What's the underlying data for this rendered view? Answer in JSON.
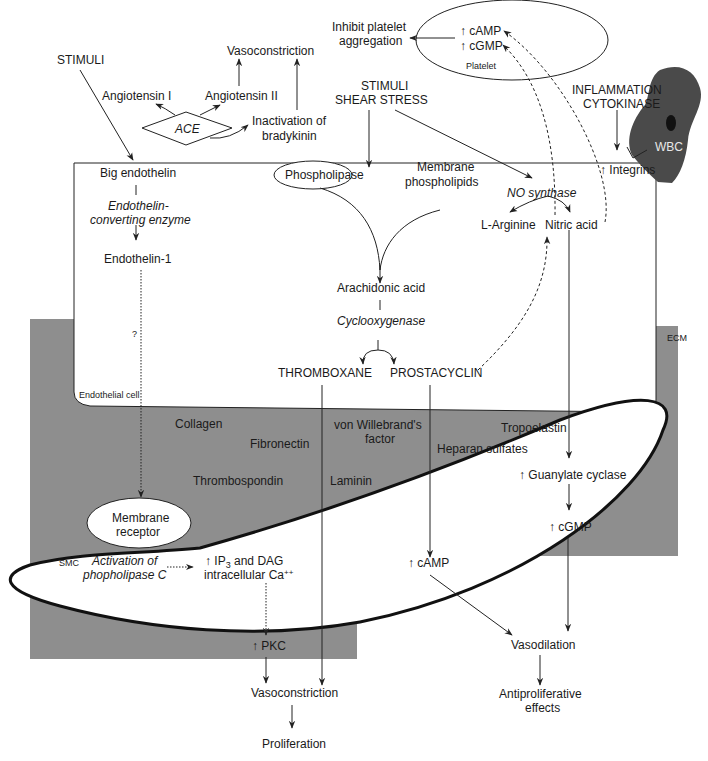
{
  "colors": {
    "ecm_fill": "#8e8e8e",
    "wbc_fill": "#4a4a4a",
    "line": "#222222",
    "background": "#ffffff"
  },
  "labels": {
    "stimuli_left": "STIMULI",
    "angiotensin_1": "Angiotensin I",
    "angiotensin_2": "Angiotensin II",
    "ace": "ACE",
    "vasoconstriction_top": "Vasoconstriction",
    "inactivation_1": "Inactivation of",
    "inactivation_2": "bradykinin",
    "inhibit_1": "Inhibit platelet",
    "inhibit_2": "aggregation",
    "platelet_camp": "↑ cAMP",
    "platelet_cgmp": "↑ cGMP",
    "platelet": "Platelet",
    "stimuli_center_1": "STIMULI",
    "stimuli_center_2": "SHEAR STRESS",
    "inflammation_1": "INFLAMMATION",
    "inflammation_2": "CYTOKINASE",
    "wbc": "WBC",
    "integrins": "↑ Integrins",
    "big_endothelin": "Big endothelin",
    "ece_1": "Endothelin-",
    "ece_2": "converting enzyme",
    "endothelin_1": "Endothelin-1",
    "question": "?",
    "endothelial_cell": "Endothelial cell",
    "phospholipase": "Phospholipase",
    "membrane_phospholipids_1": "Membrane",
    "membrane_phospholipids_2": "phospholipids",
    "no_synthase": "NO synthase",
    "l_arginine": "L-Arginine",
    "nitric_acid": "Nitric acid",
    "arachidonic_acid": "Arachidonic acid",
    "cyclooxygenase": "Cyclooxygenase",
    "thromboxane": "THROMBOXANE",
    "prostacyclin": "PROSTACYCLIN",
    "ecm": "ECM",
    "collagen": "Collagen",
    "fibronectin": "Fibronectin",
    "von_willebrand_1": "von Willebrand's",
    "von_willebrand_2": "factor",
    "tropoelastin": "Tropoelastin",
    "heparan_sulfates": "Heparan sulfates",
    "thrombospondin": "Thrombospondin",
    "laminin": "Laminin",
    "membrane_receptor_1": "Membrane",
    "membrane_receptor_2": "receptor",
    "smc": "SMC",
    "activation_plc_1": "Activation of",
    "activation_plc_2": "phopholipase C",
    "ip3_dag_1": "↑ IP",
    "ip3_sub": "3",
    "ip3_dag_1b": " and DAG",
    "ip3_dag_2": "intracellular Ca",
    "ca_sup": "++",
    "guanylate_cyclase": "↑ Guanylate cyclase",
    "cgmp_smc": "↑ cGMP",
    "camp_smc": "↑ cAMP",
    "pkc": "↑ PKC",
    "vasoconstriction_bottom": "Vasoconstriction",
    "proliferation": "Proliferation",
    "vasodilation": "Vasodilation",
    "antiproliferative_1": "Antiproliferative",
    "antiproliferative_2": "effects"
  }
}
